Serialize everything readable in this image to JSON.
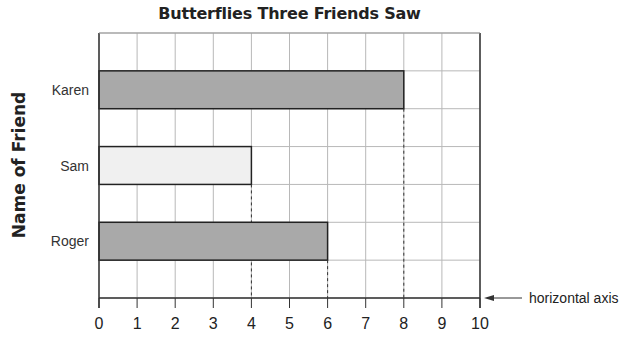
{
  "chart_data": {
    "type": "bar",
    "orientation": "horizontal",
    "title": "Butterflies Three Friends Saw",
    "xlabel": "",
    "ylabel": "Name of Friend",
    "categories": [
      "Karen",
      "Sam",
      "Roger"
    ],
    "values": [
      8,
      4,
      6
    ],
    "bar_colors": [
      "#a9a9a9",
      "#f0f0f0",
      "#a9a9a9"
    ],
    "xlim": [
      0,
      10
    ],
    "x_ticks": [
      0,
      1,
      2,
      3,
      4,
      5,
      6,
      7,
      8,
      9,
      10
    ],
    "grid": true,
    "annotation": "horizontal axis",
    "dashed_guides_at": [
      4,
      6,
      8
    ]
  }
}
